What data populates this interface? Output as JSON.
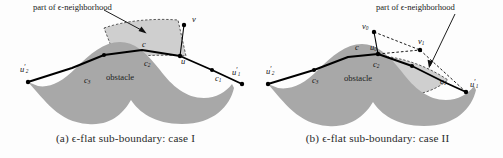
{
  "figure": {
    "background_color": "#fdfdfd",
    "obstacle_fill": "#a8a8a8",
    "neighborhood_fill": "#cfcfcf",
    "boundary_stroke": "#000000",
    "dashed_stroke": "#1a1a1a",
    "panels": [
      {
        "id": "a",
        "caption": "(a) ϵ-flat sub-boundary: case I",
        "annotation": "part of ϵ-neighborhood",
        "obstacle_label": "obstacle",
        "labels": [
          {
            "name": "vertex-v",
            "text": "v",
            "sub": "",
            "prime": false,
            "x": 193,
            "y": 20
          },
          {
            "name": "vertex-u",
            "text": "u",
            "sub": "",
            "prime": false,
            "x": 182,
            "y": 58
          },
          {
            "name": "arc-c",
            "text": "c",
            "sub": "",
            "prime": false,
            "x": 143,
            "y": 43
          },
          {
            "name": "arc-c2",
            "text": "c",
            "sub": "2",
            "prime": false,
            "x": 145,
            "y": 62
          },
          {
            "name": "arc-c1",
            "text": "c",
            "sub": "1",
            "prime": false,
            "x": 217,
            "y": 77
          },
          {
            "name": "arc-c3",
            "text": "c",
            "sub": "3",
            "prime": false,
            "x": 86,
            "y": 79
          },
          {
            "name": "vertex-u2-prime",
            "text": "u",
            "sub": "2",
            "prime": true,
            "x": 25,
            "y": 72
          },
          {
            "name": "vertex-u1-prime",
            "text": "u",
            "sub": "1",
            "prime": true,
            "x": 276,
            "y": 72
          }
        ]
      },
      {
        "id": "b",
        "caption": "(b) ϵ-flat sub-boundary: case II",
        "annotation": "part of ϵ-neighborhood",
        "obstacle_label": "obstacle",
        "labels": [
          {
            "name": "vertex-v0",
            "text": "v",
            "sub": "0",
            "prime": false,
            "x": 113,
            "y": 28
          },
          {
            "name": "vertex-v1",
            "text": "v",
            "sub": "1",
            "prime": false,
            "x": 165,
            "y": 42
          },
          {
            "name": "vertex-u0",
            "text": "u",
            "sub": "0",
            "prime": false,
            "x": 120,
            "y": 46
          },
          {
            "name": "arc-c",
            "text": "c",
            "sub": "",
            "prime": false,
            "x": 104,
            "y": 46
          },
          {
            "name": "arc-c2",
            "text": "c",
            "sub": "2",
            "prime": false,
            "x": 123,
            "y": 62
          },
          {
            "name": "arc-c1",
            "text": "c",
            "sub": "1",
            "prime": false,
            "x": 190,
            "y": 80
          },
          {
            "name": "arc-c3",
            "text": "c",
            "sub": "3",
            "prime": false,
            "x": 62,
            "y": 79
          },
          {
            "name": "vertex-u2-prime",
            "text": "u",
            "sub": "2",
            "prime": true,
            "x": 20,
            "y": 72
          },
          {
            "name": "vertex-u1-prime",
            "text": "u",
            "sub": "1",
            "prime": true,
            "x": 222,
            "y": 84
          }
        ]
      }
    ]
  }
}
